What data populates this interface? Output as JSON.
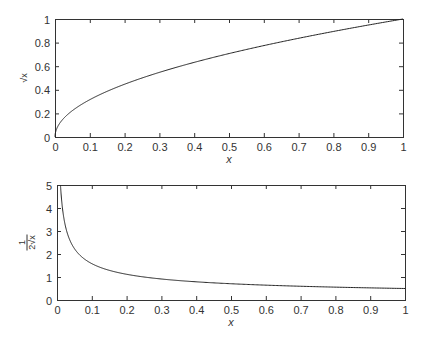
{
  "chart_data": [
    {
      "type": "line",
      "title": "",
      "xlabel": "x",
      "ylabel": "√x",
      "xlim": [
        0,
        1
      ],
      "ylim": [
        0,
        1
      ],
      "xticks": [
        "0",
        "0.1",
        "0.2",
        "0.3",
        "0.4",
        "0.5",
        "0.6",
        "0.7",
        "0.8",
        "0.9",
        "1"
      ],
      "yticks": [
        "0",
        "0.2",
        "0.4",
        "0.6",
        "0.8",
        "1"
      ],
      "grid": false,
      "series": [
        {
          "name": "sqrt(x)",
          "x": [
            0,
            0.005,
            0.01,
            0.02,
            0.04,
            0.06,
            0.1,
            0.15,
            0.2,
            0.3,
            0.4,
            0.5,
            0.6,
            0.7,
            0.8,
            0.9,
            1.0
          ],
          "y": [
            0,
            0.071,
            0.1,
            0.141,
            0.2,
            0.245,
            0.316,
            0.387,
            0.447,
            0.548,
            0.632,
            0.707,
            0.775,
            0.837,
            0.894,
            0.949,
            1.0
          ]
        }
      ],
      "frame": {
        "left": 55,
        "top": 19,
        "right": 403,
        "bottom": 137
      }
    },
    {
      "type": "line",
      "title": "",
      "xlabel": "x",
      "ylabel": "1/(2√x)",
      "ylabel_num": "1",
      "ylabel_den": "2√x",
      "xlim": [
        0,
        1
      ],
      "ylim": [
        0,
        5
      ],
      "xticks": [
        "0",
        "0.1",
        "0.2",
        "0.3",
        "0.4",
        "0.5",
        "0.6",
        "0.7",
        "0.8",
        "0.9",
        "1"
      ],
      "yticks": [
        "0",
        "1",
        "2",
        "3",
        "4",
        "5"
      ],
      "grid": false,
      "series": [
        {
          "name": "1/(2*sqrt(x))",
          "x": [
            0.01,
            0.015,
            0.02,
            0.03,
            0.04,
            0.05,
            0.06,
            0.08,
            0.1,
            0.15,
            0.2,
            0.3,
            0.4,
            0.5,
            0.6,
            0.7,
            0.8,
            0.9,
            1.0
          ],
          "y": [
            5.0,
            4.082,
            3.536,
            2.887,
            2.5,
            2.236,
            2.041,
            1.768,
            1.581,
            1.291,
            1.118,
            0.913,
            0.791,
            0.707,
            0.645,
            0.598,
            0.559,
            0.527,
            0.5
          ]
        }
      ],
      "frame": {
        "left": 57,
        "top": 185,
        "right": 405,
        "bottom": 300
      }
    }
  ]
}
